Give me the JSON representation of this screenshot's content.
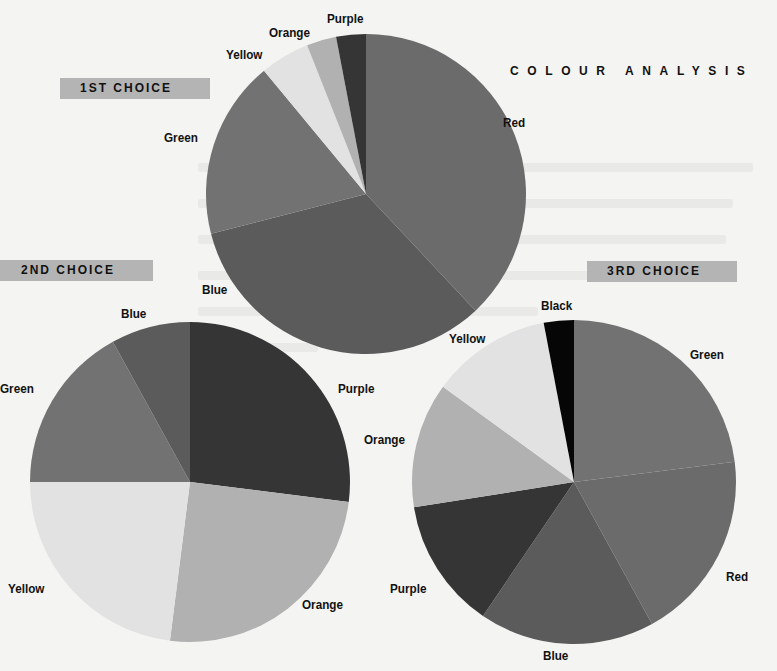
{
  "title": "COLOUR ANALYSIS",
  "choice_labels": [
    "1ST CHOICE",
    "2ND CHOICE",
    "3RD CHOICE"
  ],
  "colors": {
    "Red": "#6b6b6b",
    "Blue": "#5b5b5b",
    "Green": "#727272",
    "Yellow": "#e2e2e2",
    "Orange": "#b1b1b1",
    "Purple": "#353535",
    "Black": "#060606"
  },
  "chart_data": [
    {
      "type": "pie",
      "title": "1ST CHOICE",
      "categories": [
        "Red",
        "Blue",
        "Green",
        "Yellow",
        "Orange",
        "Purple"
      ],
      "values": [
        38,
        33,
        18,
        5,
        3,
        3
      ],
      "start_angle": "12 o'clock, clockwise",
      "center": [
        366,
        194
      ],
      "radius": 160
    },
    {
      "type": "pie",
      "title": "2ND CHOICE",
      "categories": [
        "Purple",
        "Orange",
        "Yellow",
        "Green",
        "Blue"
      ],
      "values": [
        27,
        25,
        23,
        17,
        8
      ],
      "start_angle": "12 o'clock, clockwise",
      "center": [
        190,
        482
      ],
      "radius": 160
    },
    {
      "type": "pie",
      "title": "3RD CHOICE",
      "categories": [
        "Green",
        "Red",
        "Blue",
        "Purple",
        "Orange",
        "Yellow",
        "Black"
      ],
      "values": [
        23,
        19,
        17.5,
        13,
        12.5,
        12,
        3
      ],
      "start_angle": "12 o'clock, clockwise",
      "center": [
        574,
        482
      ],
      "radius": 162
    }
  ],
  "labels": {
    "pie1": [
      {
        "text": "Red",
        "x": 503,
        "y": 115
      },
      {
        "text": "Blue",
        "x": 202,
        "y": 282
      },
      {
        "text": "Green",
        "x": 164,
        "y": 130
      },
      {
        "text": "Yellow",
        "x": 226,
        "y": 47
      },
      {
        "text": "Orange",
        "x": 269,
        "y": 25
      },
      {
        "text": "Purple",
        "x": 327,
        "y": 11
      }
    ],
    "pie2": [
      {
        "text": "Purple",
        "x": 338,
        "y": 381
      },
      {
        "text": "Orange",
        "x": 302,
        "y": 597
      },
      {
        "text": "Yellow",
        "x": 8,
        "y": 581
      },
      {
        "text": "Green",
        "x": 0,
        "y": 381
      },
      {
        "text": "Blue",
        "x": 121,
        "y": 306
      }
    ],
    "pie3": [
      {
        "text": "Green",
        "x": 690,
        "y": 347
      },
      {
        "text": "Red",
        "x": 726,
        "y": 569
      },
      {
        "text": "Blue",
        "x": 543,
        "y": 648
      },
      {
        "text": "Purple",
        "x": 390,
        "y": 581
      },
      {
        "text": "Orange",
        "x": 364,
        "y": 432
      },
      {
        "text": "Yellow",
        "x": 449,
        "y": 331
      },
      {
        "text": "Black",
        "x": 541,
        "y": 298
      }
    ]
  }
}
